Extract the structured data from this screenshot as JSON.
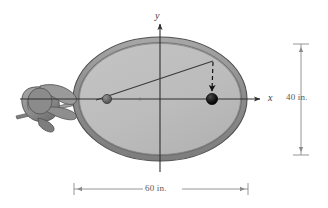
{
  "figure": {
    "type": "engineering-diagram",
    "axes": {
      "x_label": "x",
      "y_label": "y",
      "origin": {
        "x": 160,
        "y": 99
      }
    },
    "dimensions": [
      {
        "name": "table-height",
        "label": "40 in.",
        "value": 40,
        "unit": "in.",
        "orientation": "vertical"
      },
      {
        "name": "table-width",
        "label": "60 in.",
        "value": 60,
        "unit": "in.",
        "orientation": "horizontal"
      }
    ],
    "ellipse": {
      "cx": 160,
      "cy": 99,
      "rx": 87,
      "ry": 62,
      "rim_width": 7,
      "fill_color": "#bcbcbc",
      "rim_color": "#8e8e8e",
      "edge_color": "#5b5b5b"
    },
    "balls": [
      {
        "name": "cue-ball",
        "cx": 107,
        "cy": 99,
        "r": 4.5,
        "color": "#5e5e5e"
      },
      {
        "name": "target-ball",
        "cx": 212,
        "cy": 99,
        "r": 5.5,
        "color": "#1a1a1a"
      }
    ],
    "trajectory": {
      "name": "shot-path",
      "from": {
        "x": 108,
        "y": 97
      },
      "to": {
        "x": 213,
        "y": 61
      },
      "style": "solid"
    },
    "rebound": {
      "name": "rebound-path",
      "from": {
        "x": 213,
        "y": 62
      },
      "to": {
        "x": 212,
        "y": 92
      },
      "style": "dashed",
      "arrowhead": true
    },
    "cue": {
      "name": "cue-stick-and-hand",
      "description": "hand gripping pool cue at left of table"
    }
  }
}
